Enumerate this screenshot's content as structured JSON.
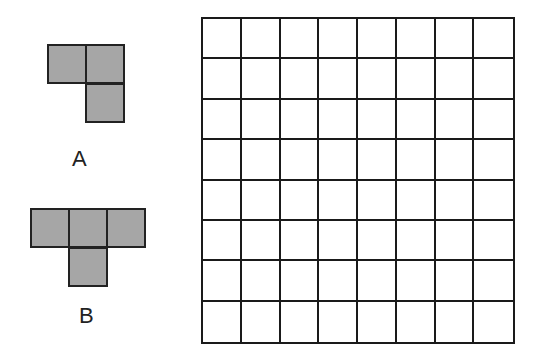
{
  "pieces": [
    {
      "label": "A",
      "name": "piece-a",
      "cells": [
        [
          0,
          0
        ],
        [
          1,
          0
        ],
        [
          1,
          1
        ]
      ],
      "origin": [
        47,
        44
      ],
      "label_pos": [
        72,
        146
      ]
    },
    {
      "label": "B",
      "name": "piece-b",
      "cells": [
        [
          0,
          0
        ],
        [
          1,
          0
        ],
        [
          2,
          0
        ],
        [
          1,
          1
        ]
      ],
      "origin": [
        30,
        208
      ],
      "label_pos": [
        79,
        303
      ]
    }
  ],
  "board": {
    "rows": 8,
    "cols": 8
  },
  "colors": {
    "piece_fill": "#a6a6a6",
    "outline": "#1a1a1a",
    "background": "#ffffff"
  }
}
